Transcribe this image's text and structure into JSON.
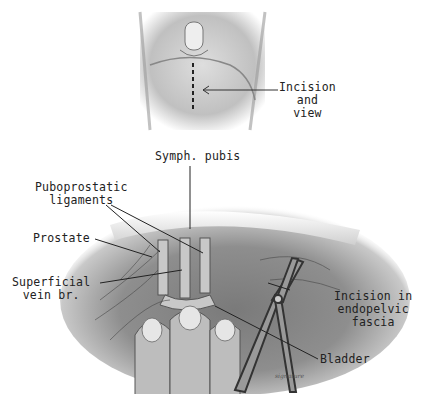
{
  "figure": {
    "top_panel": {
      "label_incision": [
        "Incision",
        "and",
        "view"
      ]
    },
    "bottom_panel": {
      "labels": {
        "symph_pubis": "Symph. pubis",
        "puboprostatic": [
          "Puboprostatic",
          "ligaments"
        ],
        "prostate": "Prostate",
        "superficial_vein": [
          "Superficial",
          "vein br."
        ],
        "incision_endopelvic": [
          "Incision in",
          "endopelvic",
          "fascia"
        ],
        "bladder": "Bladder"
      }
    }
  }
}
